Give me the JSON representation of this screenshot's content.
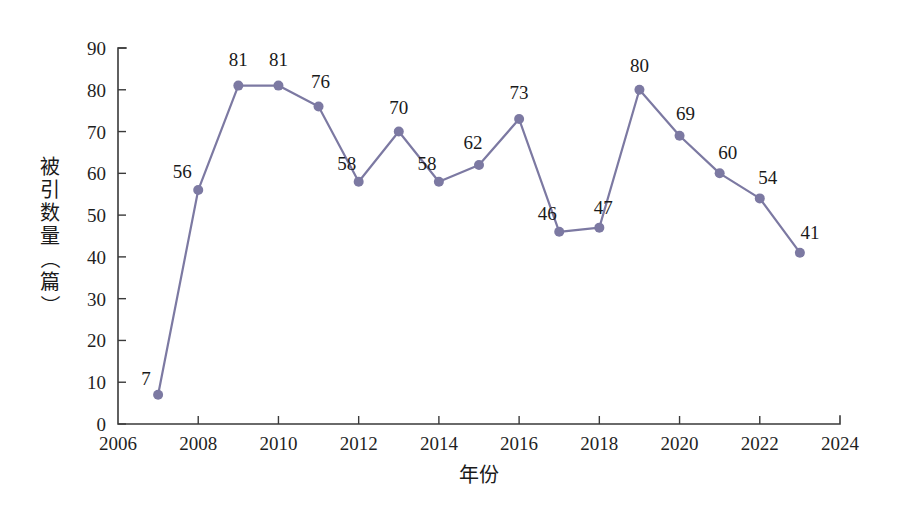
{
  "chart_data": {
    "type": "line",
    "title": "",
    "xlabel": "年份",
    "ylabel": "被引数量（篇）",
    "x": [
      2007,
      2008,
      2009,
      2010,
      2011,
      2012,
      2013,
      2014,
      2015,
      2016,
      2017,
      2018,
      2019,
      2020,
      2021,
      2022,
      2023
    ],
    "values": [
      7,
      56,
      81,
      81,
      76,
      58,
      70,
      58,
      62,
      73,
      46,
      47,
      80,
      69,
      60,
      54,
      41
    ],
    "point_labels": [
      "7",
      "56",
      "81",
      "81",
      "76",
      "58",
      "70",
      "58",
      "62",
      "73",
      "46",
      "47",
      "80",
      "69",
      "60",
      "54",
      "41"
    ],
    "xlim": [
      2006,
      2024
    ],
    "ylim": [
      0,
      90
    ],
    "x_ticks": [
      2006,
      2008,
      2010,
      2012,
      2014,
      2016,
      2018,
      2020,
      2022,
      2024
    ],
    "x_tick_labels": [
      "2006",
      "2008",
      "2010",
      "2012",
      "2014",
      "2016",
      "2018",
      "2020",
      "2022",
      "2024"
    ],
    "y_ticks": [
      0,
      10,
      20,
      30,
      40,
      50,
      60,
      70,
      80,
      90
    ],
    "y_tick_labels": [
      "0",
      "10",
      "20",
      "30",
      "40",
      "50",
      "60",
      "70",
      "80",
      "90"
    ],
    "grid": false,
    "legend": false,
    "series_color": "#7c79a2",
    "marker": "circle",
    "marker_size": 9,
    "axis_color": "#3a3a3a",
    "background": "#ffffff"
  },
  "labels": {
    "ylabel_chars": [
      "被",
      "引",
      "数",
      "量",
      "（",
      "篇",
      "）"
    ]
  }
}
